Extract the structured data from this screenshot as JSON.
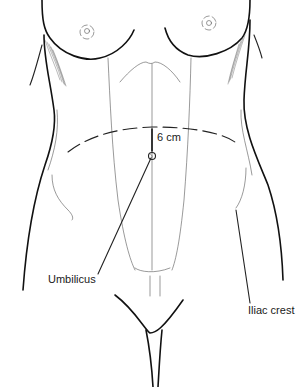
{
  "figure": {
    "labels": {
      "distance": "6 cm",
      "umbilicus": "Umbilicus",
      "iliac_crest": "Iliac crest"
    },
    "measurement": {
      "value": 6,
      "unit": "cm",
      "reference": "Umbilicus",
      "direction": "superior"
    },
    "colors": {
      "line": "#111111",
      "background": "#ffffff"
    }
  }
}
